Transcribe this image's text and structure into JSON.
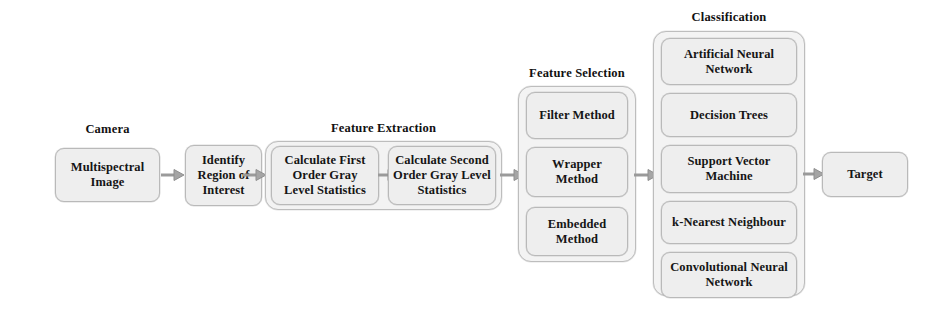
{
  "diagram": {
    "colors": {
      "node_fill": "#eeeeee",
      "node_border": "#b9b9b9",
      "group_fill": "#f3f3f3",
      "group_border": "#bdbdbd",
      "arrow": "#9a9a9a",
      "text": "#151515",
      "background": "#ffffff"
    },
    "captions": {
      "camera": "Camera",
      "feature_extraction": "Feature Extraction",
      "feature_selection": "Feature Selection",
      "classification": "Classification"
    },
    "nodes": {
      "multispectral_image": "Multispectral\nImage",
      "identify_region": "Identify\nRegion of\nInterest",
      "first_order": "Calculate First\nOrder Gray\nLevel Statistics",
      "second_order": "Calculate Second\nOrder Gray Level\nStatistics",
      "target": "Target"
    },
    "feature_selection_methods": [
      "Filter Method",
      "Wrapper\nMethod",
      "Embedded\nMethod"
    ],
    "classification_methods": [
      "Artificial Neural\nNetwork",
      "Decision Trees",
      "Support Vector\nMachine",
      "k-Nearest Neighbour",
      "Convolutional Neural\nNetwork"
    ],
    "arrows": [
      {
        "name": "arrow-image-to-region",
        "from": "multispectral_image",
        "to": "identify_region"
      },
      {
        "name": "arrow-region-to-extraction",
        "from": "identify_region",
        "to": "feature_extraction"
      },
      {
        "name": "arrow-first-to-second",
        "from": "first_order",
        "to": "second_order"
      },
      {
        "name": "arrow-extraction-to-selection",
        "from": "feature_extraction",
        "to": "feature_selection"
      },
      {
        "name": "arrow-selection-to-classification",
        "from": "feature_selection",
        "to": "classification"
      },
      {
        "name": "arrow-classification-to-target",
        "from": "classification",
        "to": "target"
      }
    ]
  }
}
